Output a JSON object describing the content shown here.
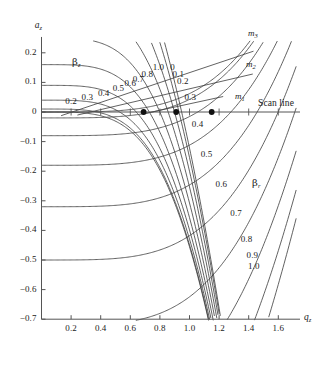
{
  "figure": {
    "background": "#ffffff",
    "line_color": "#3a3a3a",
    "axis_color": "#555555",
    "text_color": "#1b1b1b"
  },
  "axes": {
    "x_label": "q",
    "x_label_sub": "z",
    "y_label": "a",
    "y_label_sub": "z",
    "x_ticks": [
      "0.2",
      "0.4",
      "0.6",
      "0.8",
      "1.0",
      "1.2",
      "1.4",
      "1.6"
    ],
    "x_tick_values": [
      0.2,
      0.4,
      0.6,
      0.8,
      1.0,
      1.2,
      1.4,
      1.6
    ],
    "y_ticks": [
      "0.2",
      "0.1",
      "0",
      "-0.1",
      "-0.2",
      "-0.3",
      "-0.4",
      "-0.5",
      "-0.6",
      "-0.7"
    ],
    "y_tick_values": [
      0.2,
      0.1,
      0,
      -0.1,
      -0.2,
      -0.3,
      -0.4,
      -0.5,
      -0.6,
      -0.7
    ],
    "xlim": [
      0.0,
      1.72
    ],
    "ylim": [
      -0.7,
      0.24
    ]
  },
  "annotations": {
    "beta_z_family": "β",
    "beta_z_sub": "z",
    "beta_r_family": "β",
    "beta_r_sub": "r",
    "scan_line": "Scan line",
    "mass_lines": [
      {
        "label": "m",
        "sub": "1"
      },
      {
        "label": "m",
        "sub": "2"
      },
      {
        "label": "m",
        "sub": "3"
      }
    ]
  },
  "chart_data": {
    "type": "line",
    "xlabel": "q_z",
    "ylabel": "a_z",
    "xlim": [
      0.0,
      1.72
    ],
    "ylim": [
      -0.7,
      0.24
    ],
    "grid": false,
    "legend": "none",
    "series": [
      {
        "name": "beta_z contours",
        "label_values": [
          0.2,
          0.3,
          0.4,
          0.5,
          0.6,
          0.7,
          0.8,
          1.0
        ],
        "all_values": [
          0.0,
          0.1,
          0.2,
          0.3,
          0.4,
          0.5,
          0.6,
          0.7,
          0.8,
          0.9,
          1.0
        ],
        "description": "iso-beta_z curves sweeping from upper-left down to lower-right"
      },
      {
        "name": "beta_r contours",
        "label_values": [
          0,
          0.1,
          0.2,
          0.3,
          0.4,
          0.5,
          0.6,
          0.7,
          0.8,
          0.9,
          1.0
        ],
        "all_values": [
          0.0,
          0.1,
          0.2,
          0.3,
          0.4,
          0.5,
          0.6,
          0.7,
          0.8,
          0.9,
          1.0
        ],
        "description": "iso-beta_r curves crossing the beta_z family"
      },
      {
        "name": "mass scan lines",
        "values": [
          "m1",
          "m2",
          "m3"
        ],
        "description": "three straight lines of constant a/q ratio emanating toward upper right"
      },
      {
        "name": "scan line",
        "values": [
          0
        ],
        "description": "horizontal line at a_z = 0 extending across full width"
      }
    ],
    "operating_points": [
      {
        "q": 0.69,
        "a": 0.0
      },
      {
        "q": 0.91,
        "a": 0.0
      },
      {
        "q": 1.15,
        "a": 0.0
      }
    ],
    "contour_labels_beta_z": [
      {
        "text": "0.2",
        "x": 0.2,
        "y": 0.035
      },
      {
        "text": "0.3",
        "x": 0.31,
        "y": 0.047
      },
      {
        "text": "0.4",
        "x": 0.42,
        "y": 0.06
      },
      {
        "text": "0.5",
        "x": 0.52,
        "y": 0.077
      },
      {
        "text": "0.6",
        "x": 0.6,
        "y": 0.093
      },
      {
        "text": "0.7",
        "x": 0.655,
        "y": 0.108
      },
      {
        "text": "0.8",
        "x": 0.715,
        "y": 0.125
      },
      {
        "text": "1.0",
        "x": 0.79,
        "y": 0.147
      }
    ],
    "contour_labels_beta_r": [
      {
        "text": "0",
        "x": 0.885,
        "y": 0.148
      },
      {
        "text": "0.1",
        "x": 0.925,
        "y": 0.126
      },
      {
        "text": "0.2",
        "x": 0.955,
        "y": 0.1
      },
      {
        "text": "0.3",
        "x": 1.005,
        "y": 0.048
      },
      {
        "text": "0.4",
        "x": 1.055,
        "y": -0.045
      },
      {
        "text": "0.5",
        "x": 1.115,
        "y": -0.145
      },
      {
        "text": "0.6",
        "x": 1.215,
        "y": -0.247
      },
      {
        "text": "0.7",
        "x": 1.315,
        "y": -0.345
      },
      {
        "text": "0.8",
        "x": 1.385,
        "y": -0.432
      },
      {
        "text": "0.9",
        "x": 1.425,
        "y": -0.487
      },
      {
        "text": "1.0",
        "x": 1.435,
        "y": -0.522
      }
    ]
  }
}
